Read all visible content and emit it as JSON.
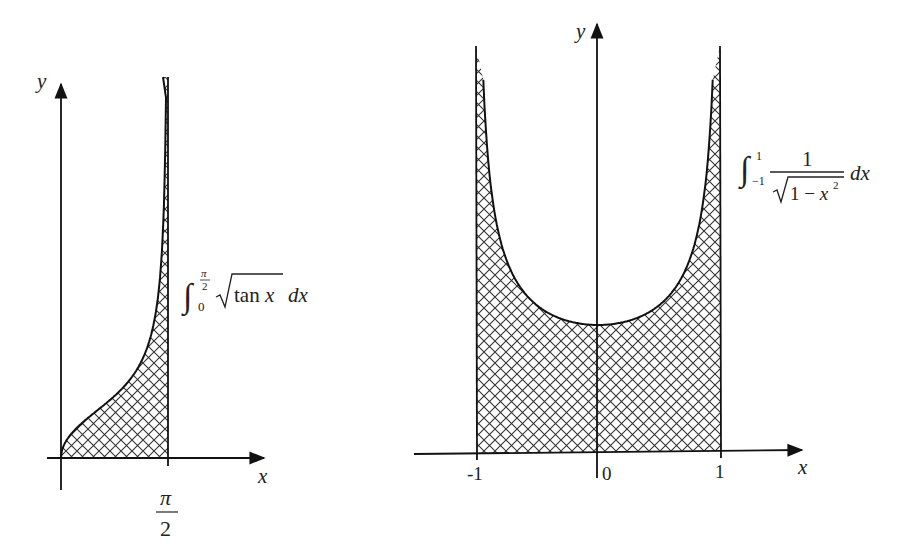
{
  "colors": {
    "ink": "#222222",
    "background": "#ffffff"
  },
  "left_plot": {
    "y_label": "y",
    "x_label": "x",
    "tick_label_numerator": "π",
    "tick_label_denominator": "2",
    "formula": {
      "upper_limit_num": "π",
      "upper_limit_den": "2",
      "lower_limit": "0",
      "radicand": "tan x",
      "differential": "dx"
    }
  },
  "right_plot": {
    "y_label": "y",
    "x_label": "x",
    "ticks": [
      "-1",
      "0",
      "1"
    ],
    "formula": {
      "upper_limit": "1",
      "lower_limit": "−1",
      "numerator": "1",
      "denominator_radicand": "1 − x",
      "exponent": "2",
      "differential": "dx"
    }
  },
  "chart_data": [
    {
      "type": "area",
      "title": "∫₀^{π/2} √(tan x) dx",
      "function": "y = sqrt(tan x)",
      "xlabel": "x",
      "ylabel": "y",
      "xlim": [
        0,
        1.5708
      ],
      "x_ticks": [
        "π/2"
      ],
      "shaded_region": "0 ≤ x ≤ π/2 (cross-hatched)",
      "x": [
        0,
        0.2,
        0.4,
        0.6,
        0.8,
        1.0,
        1.2,
        1.3,
        1.4,
        1.45,
        1.5
      ],
      "values": [
        0,
        0.45,
        0.65,
        0.83,
        1.01,
        1.25,
        1.6,
        1.9,
        2.4,
        2.8,
        3.8
      ],
      "grid": false
    },
    {
      "type": "area",
      "title": "∫₋₁^{1} 1/√(1−x²) dx",
      "function": "y = 1/sqrt(1 - x^2)",
      "xlabel": "x",
      "ylabel": "y",
      "xlim": [
        -1,
        1
      ],
      "x_ticks": [
        "-1",
        "0",
        "1"
      ],
      "shaded_region": "-1 ≤ x ≤ 1 (cross-hatched)",
      "x": [
        -0.95,
        -0.9,
        -0.8,
        -0.6,
        -0.4,
        -0.2,
        0,
        0.2,
        0.4,
        0.6,
        0.8,
        0.9,
        0.95
      ],
      "values": [
        3.2,
        2.29,
        1.67,
        1.25,
        1.09,
        1.02,
        1.0,
        1.02,
        1.09,
        1.25,
        1.67,
        2.29,
        3.2
      ],
      "grid": false
    }
  ]
}
